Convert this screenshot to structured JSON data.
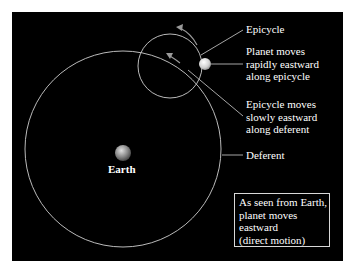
{
  "diagram": {
    "labels": {
      "epicycle": "Epicycle",
      "planet_motion": "Planet moves\nrapidly eastward\nalong epicycle",
      "epicycle_motion": "Epicycle moves\nslowly eastward\nalong deferent",
      "deferent": "Deferent",
      "earth": "Earth"
    },
    "note_box": {
      "text": "As seen from Earth,\nplanet moves\neastward\n(direct motion)"
    },
    "colors": {
      "background": "#000000",
      "lines": "#cfcfcf",
      "text": "#ffffff",
      "page": "#ffffff"
    }
  }
}
